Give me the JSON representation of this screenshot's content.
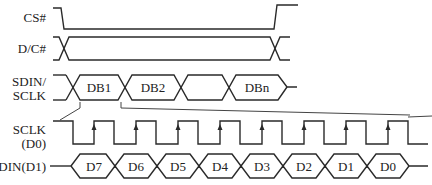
{
  "diagram": {
    "type": "timing-diagram",
    "signals": [
      {
        "id": "cs",
        "label": "CS#"
      },
      {
        "id": "dc",
        "label": "D/C#"
      },
      {
        "id": "bus",
        "label_line1": "SDIN/",
        "label_line2": "SCLK"
      },
      {
        "id": "sclk",
        "label_line1": "SCLK",
        "label_line2": "(D0)"
      },
      {
        "id": "sdin",
        "label": "SDIN(D1)"
      }
    ],
    "bus_segments": [
      "DB1",
      "DB2",
      "",
      "DBn"
    ],
    "bit_segments": [
      "D7",
      "D6",
      "D5",
      "D4",
      "D3",
      "D2",
      "D1",
      "D0"
    ],
    "sclk_rising_edge_marker": "arrow-up",
    "sclk_pulse_count": 8,
    "stroke_color": "#2a2a2a",
    "background_color": "#ffffff"
  }
}
